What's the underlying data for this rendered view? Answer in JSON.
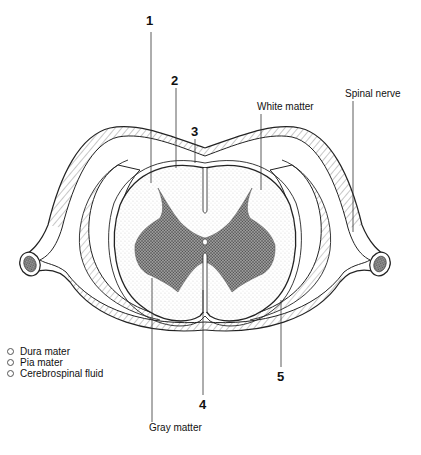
{
  "diagram": {
    "numbered_labels": [
      {
        "id": "1",
        "x": 147,
        "y": 22
      },
      {
        "id": "2",
        "x": 172,
        "y": 78
      },
      {
        "id": "3",
        "x": 192,
        "y": 130
      },
      {
        "id": "4",
        "x": 199,
        "y": 404
      },
      {
        "id": "5",
        "x": 277,
        "y": 377
      }
    ],
    "text_labels": {
      "white_matter": "White matter",
      "spinal_nerve": "Spinal nerve",
      "gray_matter": "Gray matter"
    },
    "legend": [
      {
        "label": "Dura mater",
        "selected": false
      },
      {
        "label": "Pia mater",
        "selected": false
      },
      {
        "label": "Cerebrospinal fluid",
        "selected": false
      }
    ]
  }
}
